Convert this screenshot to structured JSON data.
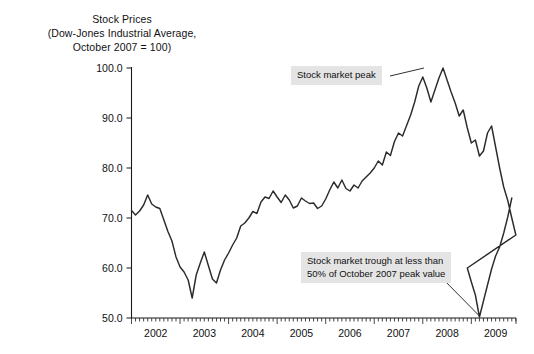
{
  "title": {
    "line1": "Stock Prices",
    "line2": "(Dow-Jones Industrial Average,",
    "line3": "October 2007 = 100)"
  },
  "annotations": {
    "peak": {
      "text": "Stock market peak"
    },
    "trough": {
      "line1": "Stock market trough at less than",
      "line2": "50% of October 2007 peak value"
    }
  },
  "chart_data": {
    "type": "line",
    "title": "Stock Prices (Dow-Jones Industrial Average, October 2007 = 100)",
    "xlabel": "",
    "ylabel": "",
    "xlim": [
      2002.0,
      2009.92
    ],
    "ylim": [
      50.0,
      100.0
    ],
    "grid": false,
    "legend": false,
    "ytick_labels": [
      "50.0",
      "60.0",
      "70.0",
      "80.0",
      "90.0",
      "100.0"
    ],
    "ytick_values": [
      50,
      60,
      70,
      80,
      90,
      100
    ],
    "xtick_labels": [
      "2002",
      "2003",
      "2004",
      "2005",
      "2006",
      "2007",
      "2008",
      "2009"
    ],
    "xtick_values": [
      2002,
      2003,
      2004,
      2005,
      2006,
      2007,
      2008,
      2009
    ],
    "minor_ticks_per_year": 12,
    "line_color": "#2b2b2b",
    "series": [
      {
        "name": "Dow-Jones Industrial Average (Oct 2007 = 100)",
        "x": [
          2002.0,
          2002.083,
          2002.167,
          2002.25,
          2002.333,
          2002.417,
          2002.5,
          2002.583,
          2002.667,
          2002.75,
          2002.833,
          2002.917,
          2003.0,
          2003.083,
          2003.167,
          2003.25,
          2003.333,
          2003.417,
          2003.5,
          2003.583,
          2003.667,
          2003.75,
          2003.833,
          2003.917,
          2004.0,
          2004.083,
          2004.167,
          2004.25,
          2004.333,
          2004.417,
          2004.5,
          2004.583,
          2004.667,
          2004.75,
          2004.833,
          2004.917,
          2005.0,
          2005.083,
          2005.167,
          2005.25,
          2005.333,
          2005.417,
          2005.5,
          2005.583,
          2005.667,
          2005.75,
          2005.833,
          2005.917,
          2006.0,
          2006.083,
          2006.167,
          2006.25,
          2006.333,
          2006.417,
          2006.5,
          2006.583,
          2006.667,
          2006.75,
          2006.833,
          2006.917,
          2007.0,
          2007.083,
          2007.167,
          2007.25,
          2007.333,
          2007.417,
          2007.5,
          2007.583,
          2007.667,
          2007.75,
          2007.833,
          2007.917,
          2008.0,
          2008.083,
          2008.167,
          2008.25,
          2008.333,
          2008.417,
          2008.5,
          2008.583,
          2008.667,
          2008.75,
          2008.833,
          2008.917,
          2009.0,
          2009.083,
          2009.167,
          2009.25,
          2009.333,
          2009.417,
          2009.5,
          2009.583,
          2009.667,
          2009.75,
          2009.833,
          2009.917
        ],
        "y": [
          71.5,
          70.6,
          71.4,
          72.6,
          74.6,
          72.8,
          72.2,
          71.9,
          69.6,
          67.3,
          65.4,
          62.2,
          60.2,
          59.2,
          57.6,
          54.0,
          58.6,
          61.0,
          63.2,
          60.5,
          57.8,
          57.0,
          59.6,
          61.6,
          63.0,
          64.6,
          66.0,
          68.4,
          69.0,
          70.0,
          71.3,
          70.9,
          73.2,
          74.2,
          73.9,
          75.4,
          74.2,
          73.1,
          74.6,
          73.6,
          72.0,
          72.4,
          74.0,
          73.4,
          72.9,
          73.0,
          71.9,
          72.4,
          73.8,
          75.6,
          77.2,
          76.0,
          77.6,
          75.9,
          75.4,
          76.6,
          76.0,
          77.4,
          78.2,
          79.0,
          80.0,
          81.4,
          80.6,
          83.2,
          82.5,
          85.3,
          87.0,
          86.4,
          88.5,
          90.6,
          93.2,
          96.4,
          98.2,
          96.0,
          93.2,
          95.6,
          98.0,
          100.0,
          97.6,
          95.2,
          93.0,
          90.4,
          91.6,
          88.0,
          85.0,
          85.6,
          82.4,
          83.4,
          87.0,
          88.4,
          84.2,
          80.0,
          76.2,
          73.5,
          70.0,
          66.6
        ]
      }
    ],
    "series_extended": {
      "note": "continuation of monthly values through end of chart",
      "x": [
        2008.917,
        2009.0,
        2009.083,
        2009.167,
        2009.25,
        2009.333,
        2009.417,
        2009.5,
        2009.583,
        2009.667,
        2009.75,
        2009.833
      ],
      "y": [
        60.0,
        57.2,
        54.6,
        50.2,
        53.4,
        56.6,
        59.8,
        62.4,
        64.2,
        67.0,
        70.2,
        74.0
      ]
    },
    "key_points": [
      {
        "label": "Stock market peak",
        "x": 2007.833,
        "y": 100.0
      },
      {
        "label": "Stock market trough",
        "x": 2009.167,
        "y": 50.2
      },
      {
        "label": "2002 local high",
        "x": 2002.333,
        "y": 74.6
      },
      {
        "label": "2002 low",
        "x": 2002.75,
        "y": 54.0
      },
      {
        "label": "2003 second low",
        "x": 2003.167,
        "y": 57.0
      }
    ]
  }
}
